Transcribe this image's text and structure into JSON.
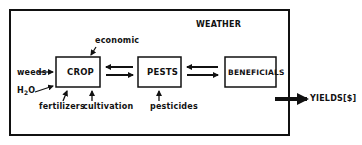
{
  "diagram": {
    "frame_label": "WEATHER",
    "nodes": [
      {
        "id": "crop",
        "label": "CROP"
      },
      {
        "id": "pests",
        "label": "PESTS"
      },
      {
        "id": "beneficials",
        "label": "BENEFICIALS"
      }
    ],
    "inputs": {
      "weeds": "weeds",
      "water_main": "H",
      "water_sub": "2",
      "water_tail": "O",
      "fertilizers": "fertilizers",
      "cultivation": "cultivation",
      "economic": "economic",
      "pesticides": "pesticides"
    },
    "output": {
      "label": "YIELDS[$]"
    },
    "edges": [
      {
        "from": "crop",
        "to": "pests",
        "bidirectional": true
      },
      {
        "from": "pests",
        "to": "beneficials",
        "bidirectional": true
      },
      {
        "from": "weeds",
        "to": "crop"
      },
      {
        "from": "H2O",
        "to": "crop"
      },
      {
        "from": "fertilizers",
        "to": "crop"
      },
      {
        "from": "cultivation",
        "to": "crop"
      },
      {
        "from": "economic",
        "to": "crop"
      },
      {
        "from": "pesticides",
        "to": "pests"
      },
      {
        "from": "system",
        "to": "yields"
      }
    ]
  }
}
